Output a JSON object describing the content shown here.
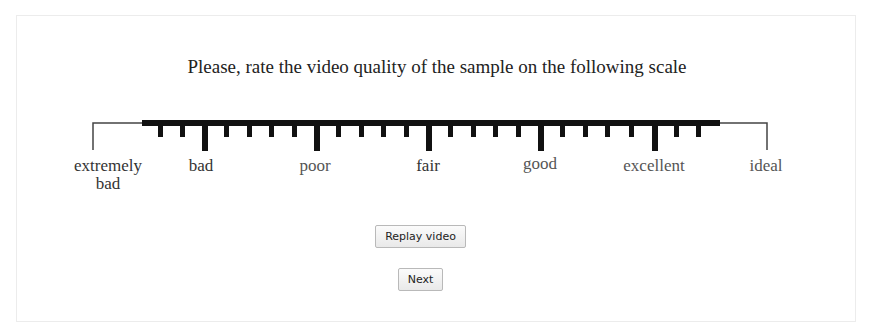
{
  "prompt": {
    "title": "Please, rate the video quality of the sample on the following scale"
  },
  "scale": {
    "labels": [
      {
        "text_line1": "extremely",
        "text_line2": "bad"
      },
      {
        "text_line1": "bad"
      },
      {
        "text_line1": "poor"
      },
      {
        "text_line1": "fair"
      },
      {
        "text_line1": "good"
      },
      {
        "text_line1": "excellent"
      },
      {
        "text_line1": "ideal"
      }
    ],
    "minor_ticks_between_labels": 4,
    "colors": {
      "bar": "#111111",
      "endline": "#444444"
    }
  },
  "buttons": {
    "replay_label": "Replay video",
    "next_label": "Next"
  }
}
